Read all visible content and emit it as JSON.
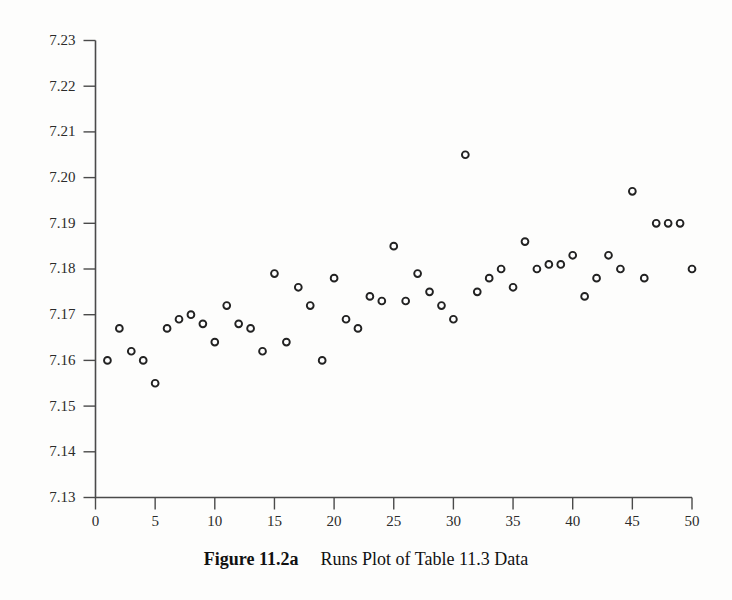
{
  "caption": {
    "label": "Figure 11.2a",
    "text": "Runs Plot of Table 11.3 Data"
  },
  "colors": {
    "background": "#fdfdfc",
    "axis": "#4a4a4a",
    "marker_stroke": "#222222",
    "marker_fill": "#ffffff",
    "text": "#2b2b2b"
  },
  "chart_data": {
    "type": "scatter",
    "title": "Runs Plot of Table 11.3 Data",
    "xlabel": "",
    "ylabel": "",
    "xlim": [
      0,
      50
    ],
    "ylim": [
      7.13,
      7.23
    ],
    "grid": false,
    "legend": false,
    "xticks": [
      0,
      5,
      10,
      15,
      20,
      25,
      30,
      35,
      40,
      45,
      50
    ],
    "xtick_labels": [
      "0",
      "5",
      "10",
      "15",
      "20",
      "25",
      "30",
      "35",
      "40",
      "45",
      "50"
    ],
    "yticks": [
      7.13,
      7.14,
      7.15,
      7.16,
      7.17,
      7.18,
      7.19,
      7.2,
      7.21,
      7.22,
      7.23
    ],
    "ytick_labels": [
      "7.13",
      "7.14",
      "7.15",
      "7.16",
      "7.17",
      "7.18",
      "7.19",
      "7.20",
      "7.21",
      "7.22",
      "7.23"
    ],
    "marker": "open-circle",
    "x": [
      1,
      2,
      3,
      4,
      5,
      6,
      7,
      8,
      9,
      10,
      11,
      12,
      13,
      14,
      15,
      16,
      17,
      18,
      19,
      20,
      21,
      22,
      23,
      24,
      25,
      26,
      27,
      28,
      29,
      30,
      31,
      32,
      33,
      34,
      35,
      36,
      37,
      38,
      39,
      40,
      41,
      42,
      43,
      44,
      45,
      46,
      47,
      48,
      49,
      50
    ],
    "y": [
      7.16,
      7.167,
      7.162,
      7.16,
      7.155,
      7.167,
      7.169,
      7.17,
      7.168,
      7.164,
      7.172,
      7.168,
      7.167,
      7.162,
      7.179,
      7.164,
      7.176,
      7.172,
      7.16,
      7.178,
      7.169,
      7.167,
      7.174,
      7.173,
      7.185,
      7.173,
      7.179,
      7.175,
      7.172,
      7.169,
      7.205,
      7.175,
      7.178,
      7.18,
      7.176,
      7.186,
      7.18,
      7.181,
      7.181,
      7.183,
      7.174,
      7.178,
      7.183,
      7.18,
      7.197,
      7.178,
      7.19,
      7.19,
      7.19,
      7.18
    ]
  }
}
